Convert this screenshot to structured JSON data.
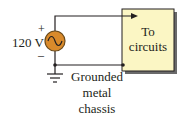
{
  "diagram": {
    "source": {
      "voltage_label": "120 V",
      "plus": "+",
      "minus": "–",
      "symbol": "ac-source-icon"
    },
    "box": {
      "line1": "To",
      "line2": "circuits"
    },
    "ground_label": {
      "line1": "Grounded",
      "line2": "metal",
      "line3": "chassis"
    },
    "colors": {
      "box_fill": "#fbf6c4",
      "source_fill": "#d98a2b",
      "wire": "#231f20",
      "shadow": "#5a5a5a"
    }
  }
}
